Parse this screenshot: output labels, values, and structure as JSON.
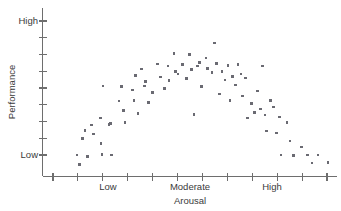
{
  "figure": {
    "background_color": "#ffffff",
    "axis_color": "#6e6e6e",
    "point_color": "#6a6a72",
    "text_color": "#3a3a3a"
  },
  "axes": {
    "x": {
      "title": "Arousal",
      "tick_labels": [
        "Low",
        "Moderate",
        "High"
      ],
      "tick_count": 12
    },
    "y": {
      "title": "Performance",
      "tick_labels": [
        "High",
        "Low"
      ],
      "tick_count": 9
    }
  },
  "chart_data": {
    "type": "scatter",
    "title": "",
    "xlabel": "Arousal",
    "ylabel": "Performance",
    "xlim": [
      0,
      100
    ],
    "ylim": [
      0,
      100
    ],
    "grid": false,
    "legend": null,
    "x_tick_labels": [
      "Low",
      "Moderate",
      "High"
    ],
    "x_tick_positions": [
      22,
      50,
      78
    ],
    "y_tick_labels": [
      "Low",
      "High"
    ],
    "y_tick_positions": [
      8,
      100
    ],
    "points": [
      {
        "x": 11.7,
        "y": 8.0
      },
      {
        "x": 12.6,
        "y": 1.5
      },
      {
        "x": 13.5,
        "y": 19.5
      },
      {
        "x": 14.4,
        "y": 25.0
      },
      {
        "x": 15.3,
        "y": 7.0
      },
      {
        "x": 16.6,
        "y": 28.5
      },
      {
        "x": 17.4,
        "y": 22.5
      },
      {
        "x": 19.6,
        "y": 33.5
      },
      {
        "x": 19.9,
        "y": 16.0
      },
      {
        "x": 20.2,
        "y": 8.5
      },
      {
        "x": 20.6,
        "y": 55.5
      },
      {
        "x": 22.6,
        "y": 29.0
      },
      {
        "x": 23.0,
        "y": 29.5
      },
      {
        "x": 23.4,
        "y": 8.0
      },
      {
        "x": 26.0,
        "y": 45.0
      },
      {
        "x": 26.9,
        "y": 55.0
      },
      {
        "x": 27.6,
        "y": 38.5
      },
      {
        "x": 28.0,
        "y": 30.5
      },
      {
        "x": 30.5,
        "y": 52.5
      },
      {
        "x": 31.0,
        "y": 45.5
      },
      {
        "x": 31.5,
        "y": 62.5
      },
      {
        "x": 32.4,
        "y": 36.5
      },
      {
        "x": 33.6,
        "y": 67.0
      },
      {
        "x": 34.6,
        "y": 55.5
      },
      {
        "x": 35.0,
        "y": 58.5
      },
      {
        "x": 36.0,
        "y": 44.0
      },
      {
        "x": 37.4,
        "y": 51.0
      },
      {
        "x": 39.0,
        "y": 70.5
      },
      {
        "x": 40.0,
        "y": 61.5
      },
      {
        "x": 41.5,
        "y": 53.5
      },
      {
        "x": 42.6,
        "y": 69.0
      },
      {
        "x": 43.0,
        "y": 59.0
      },
      {
        "x": 44.6,
        "y": 77.5
      },
      {
        "x": 45.2,
        "y": 65.5
      },
      {
        "x": 46.0,
        "y": 63.5
      },
      {
        "x": 47.6,
        "y": 70.0
      },
      {
        "x": 48.8,
        "y": 60.5
      },
      {
        "x": 50.0,
        "y": 77.0
      },
      {
        "x": 50.6,
        "y": 66.5
      },
      {
        "x": 51.5,
        "y": 36.0
      },
      {
        "x": 52.6,
        "y": 69.0
      },
      {
        "x": 53.4,
        "y": 71.5
      },
      {
        "x": 54.0,
        "y": 55.0
      },
      {
        "x": 55.5,
        "y": 74.5
      },
      {
        "x": 56.0,
        "y": 67.5
      },
      {
        "x": 57.5,
        "y": 64.5
      },
      {
        "x": 58.4,
        "y": 85.0
      },
      {
        "x": 59.0,
        "y": 71.0
      },
      {
        "x": 60.0,
        "y": 50.0
      },
      {
        "x": 61.0,
        "y": 65.5
      },
      {
        "x": 62.0,
        "y": 59.5
      },
      {
        "x": 63.0,
        "y": 69.5
      },
      {
        "x": 63.6,
        "y": 45.5
      },
      {
        "x": 64.6,
        "y": 62.0
      },
      {
        "x": 65.5,
        "y": 56.0
      },
      {
        "x": 66.4,
        "y": 70.0
      },
      {
        "x": 67.4,
        "y": 63.5
      },
      {
        "x": 68.0,
        "y": 48.5
      },
      {
        "x": 69.0,
        "y": 61.0
      },
      {
        "x": 69.6,
        "y": 33.5
      },
      {
        "x": 71.0,
        "y": 43.5
      },
      {
        "x": 72.0,
        "y": 37.0
      },
      {
        "x": 73.0,
        "y": 52.0
      },
      {
        "x": 74.0,
        "y": 39.5
      },
      {
        "x": 74.8,
        "y": 69.0
      },
      {
        "x": 75.5,
        "y": 35.5
      },
      {
        "x": 76.0,
        "y": 24.5
      },
      {
        "x": 77.5,
        "y": 45.5
      },
      {
        "x": 78.5,
        "y": 41.0
      },
      {
        "x": 79.4,
        "y": 23.0
      },
      {
        "x": 80.5,
        "y": 34.0
      },
      {
        "x": 81.0,
        "y": 8.0
      },
      {
        "x": 83.0,
        "y": 30.5
      },
      {
        "x": 84.0,
        "y": 17.5
      },
      {
        "x": 85.2,
        "y": 7.5
      },
      {
        "x": 88.0,
        "y": 13.5
      },
      {
        "x": 90.0,
        "y": 8.0
      },
      {
        "x": 91.5,
        "y": 2.5
      },
      {
        "x": 93.5,
        "y": 8.0
      },
      {
        "x": 97.0,
        "y": 3.0
      }
    ]
  }
}
